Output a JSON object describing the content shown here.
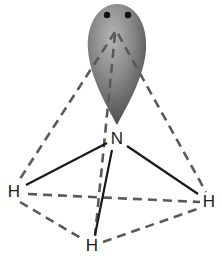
{
  "diagram": {
    "type": "molecular-geometry",
    "atoms": [
      {
        "id": "N",
        "label": "N",
        "x": 117,
        "y": 138
      },
      {
        "id": "H1",
        "label": "H",
        "x": 14,
        "y": 191
      },
      {
        "id": "H2",
        "label": "H",
        "x": 209,
        "y": 201
      },
      {
        "id": "H3",
        "label": "H",
        "x": 92,
        "y": 245
      }
    ],
    "lone_pair": {
      "electrons": 2,
      "color": "#7a7a7a"
    },
    "bonds": [
      {
        "from": "N",
        "to": "H1",
        "style": "solid"
      },
      {
        "from": "N",
        "to": "H2",
        "style": "solid"
      },
      {
        "from": "N",
        "to": "H3",
        "style": "solid"
      }
    ],
    "tetrahedron_edges": [
      {
        "from": "apex",
        "to": "H1",
        "style": "dashed"
      },
      {
        "from": "apex",
        "to": "H2",
        "style": "dashed"
      },
      {
        "from": "apex",
        "to": "H3",
        "style": "dashed"
      },
      {
        "from": "H1",
        "to": "H2",
        "style": "dashed"
      },
      {
        "from": "H1",
        "to": "H3",
        "style": "dashed"
      },
      {
        "from": "H3",
        "to": "H2",
        "style": "dashed"
      }
    ]
  }
}
